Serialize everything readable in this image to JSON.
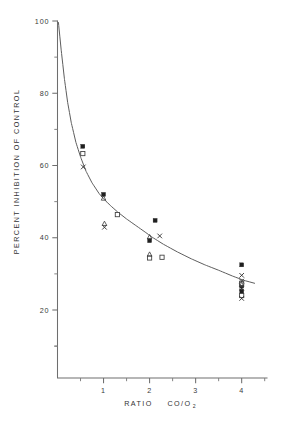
{
  "figure": {
    "background_color": "#ffffff",
    "ink_color": "#3a3a3a"
  },
  "chart_data": {
    "type": "scatter",
    "title": "",
    "subtitle": "",
    "xlabel_main": "RATIO",
    "xlabel_formula": "CO/O",
    "xlabel_formula_sub": "2",
    "xlabel": "RATIO  CO/O2",
    "ylabel": "PERCENT INHIBITION OF CONTROL",
    "xlim": [
      0,
      4.55
    ],
    "ylim": [
      8,
      100
    ],
    "grid": false,
    "legend": "none",
    "x_major_ticks": [
      1,
      2,
      3,
      4
    ],
    "x_major_tick_labels": [
      "1",
      "2",
      "3",
      "4"
    ],
    "x_minor_ticks": [
      0.5,
      1.5,
      2.5,
      3.5,
      4.5
    ],
    "y_major_ticks": [
      20,
      40,
      60,
      80,
      100
    ],
    "y_major_tick_labels": [
      "20",
      "40",
      "60",
      "80",
      "100"
    ],
    "y_minor_ticks": [
      10,
      30,
      50,
      70,
      90
    ],
    "fit_curve": {
      "name": "fitted decay curve",
      "points": [
        [
          0.02,
          99.6
        ],
        [
          0.08,
          92.0
        ],
        [
          0.15,
          84.0
        ],
        [
          0.22,
          77.5
        ],
        [
          0.3,
          71.8
        ],
        [
          0.4,
          66.4
        ],
        [
          0.5,
          62.4
        ],
        [
          0.62,
          58.4
        ],
        [
          0.75,
          55.2
        ],
        [
          0.9,
          52.3
        ],
        [
          1.0,
          50.8
        ],
        [
          1.15,
          48.9
        ],
        [
          1.3,
          47.2
        ],
        [
          1.5,
          45.2
        ],
        [
          1.7,
          43.4
        ],
        [
          1.9,
          41.6
        ],
        [
          2.05,
          40.2
        ],
        [
          2.3,
          38.2
        ],
        [
          2.6,
          36.1
        ],
        [
          2.9,
          34.2
        ],
        [
          3.2,
          32.5
        ],
        [
          3.5,
          31.0
        ],
        [
          3.8,
          29.4
        ],
        [
          4.05,
          28.2
        ],
        [
          4.28,
          27.4
        ]
      ]
    },
    "series": [
      {
        "name": "filled square",
        "marker": "filled-square",
        "points": [
          [
            0.55,
            65.3
          ],
          [
            1.0,
            52.0
          ],
          [
            2.0,
            39.2
          ],
          [
            2.12,
            44.8
          ],
          [
            4.0,
            32.5
          ],
          [
            4.0,
            26.6
          ],
          [
            4.0,
            25.2
          ]
        ]
      },
      {
        "name": "open square",
        "marker": "open-square",
        "points": [
          [
            0.55,
            63.3
          ],
          [
            1.3,
            46.4
          ],
          [
            2.0,
            34.4
          ],
          [
            2.27,
            34.6
          ],
          [
            4.0,
            27.4
          ],
          [
            4.0,
            24.0
          ]
        ]
      },
      {
        "name": "cross",
        "marker": "cross",
        "points": [
          [
            0.56,
            59.6
          ],
          [
            1.02,
            42.9
          ],
          [
            2.22,
            40.5
          ],
          [
            4.0,
            29.6
          ],
          [
            4.0,
            28.0
          ],
          [
            4.0,
            26.0
          ],
          [
            4.0,
            23.2
          ]
        ]
      },
      {
        "name": "triangle",
        "marker": "triangle",
        "points": [
          [
            1.0,
            50.9
          ],
          [
            1.02,
            43.9
          ],
          [
            2.0,
            40.2
          ],
          [
            2.0,
            35.4
          ],
          [
            4.0,
            27.0
          ]
        ]
      }
    ]
  }
}
